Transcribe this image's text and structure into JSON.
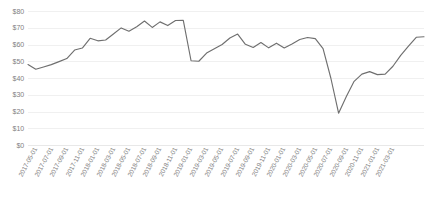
{
  "chart_data": {
    "type": "line",
    "title": "",
    "xlabel": "",
    "ylabel": "",
    "ylim": [
      0,
      80
    ],
    "ytick_step": 10,
    "ytick_labels": [
      "$80",
      "$70",
      "$60",
      "$50",
      "$40",
      "$30",
      "$20",
      "$10",
      "$0"
    ],
    "ytick_values": [
      80,
      70,
      60,
      50,
      40,
      30,
      20,
      10,
      0
    ],
    "grid": true,
    "legend": false,
    "legend_position": "none",
    "line_color": "#6f6f6f",
    "gridline_color": "#f0f0f0",
    "axis_text_color": "#808080",
    "background_color": "#ffffff",
    "xtick_labels": [
      "2017-05-01",
      "2017-07-01",
      "2017-09-01",
      "2017-11-01",
      "2018-01-01",
      "2018-03-01",
      "2018-05-01",
      "2018-07-01",
      "2018-09-01",
      "2018-11-01",
      "2019-01-01",
      "2019-03-01",
      "2019-05-01",
      "2019-07-01",
      "2019-09-01",
      "2019-11-01",
      "2020-01-01",
      "2020-03-01",
      "2020-05-01",
      "2020-07-01",
      "2020-09-01",
      "2020-11-01",
      "2021-01-01",
      "2021-03-01"
    ],
    "x": [
      "2017-05-01",
      "2017-06-01",
      "2017-07-01",
      "2017-08-01",
      "2017-09-01",
      "2017-10-01",
      "2017-11-01",
      "2017-12-01",
      "2018-01-01",
      "2018-02-01",
      "2018-03-01",
      "2018-04-01",
      "2018-05-01",
      "2018-06-01",
      "2018-07-01",
      "2018-08-01",
      "2018-09-01",
      "2018-10-01",
      "2018-11-01",
      "2018-12-01",
      "2019-01-01",
      "2019-02-01",
      "2019-03-01",
      "2019-04-01",
      "2019-05-01",
      "2019-06-01",
      "2019-07-01",
      "2019-08-01",
      "2019-09-01",
      "2019-10-01",
      "2019-11-01",
      "2019-12-01",
      "2020-01-01",
      "2020-02-01",
      "2020-03-01",
      "2020-04-01",
      "2020-05-01",
      "2020-06-01",
      "2020-07-01",
      "2020-08-01",
      "2020-09-01",
      "2020-10-01",
      "2020-11-01",
      "2020-12-01",
      "2021-01-01",
      "2021-02-01",
      "2021-03-01"
    ],
    "values": [
      48.0,
      45.2,
      46.6,
      48.0,
      49.8,
      51.6,
      56.7,
      57.9,
      63.7,
      62.2,
      62.7,
      66.3,
      69.9,
      67.9,
      70.6,
      74.0,
      70.2,
      73.5,
      71.3,
      74.3,
      74.4,
      50.3,
      50.0,
      54.9,
      57.5,
      60.0,
      63.9,
      66.2,
      60.1,
      58.2,
      61.2,
      58.0,
      60.8,
      57.9,
      60.3,
      63.0,
      64.2,
      63.5,
      57.5,
      40.0,
      19.0,
      29.0,
      38.0,
      42.3,
      43.8,
      42.0,
      42.3
    ],
    "values_tail": [
      47.0,
      53.5,
      59.0,
      64.3,
      64.6
    ]
  }
}
